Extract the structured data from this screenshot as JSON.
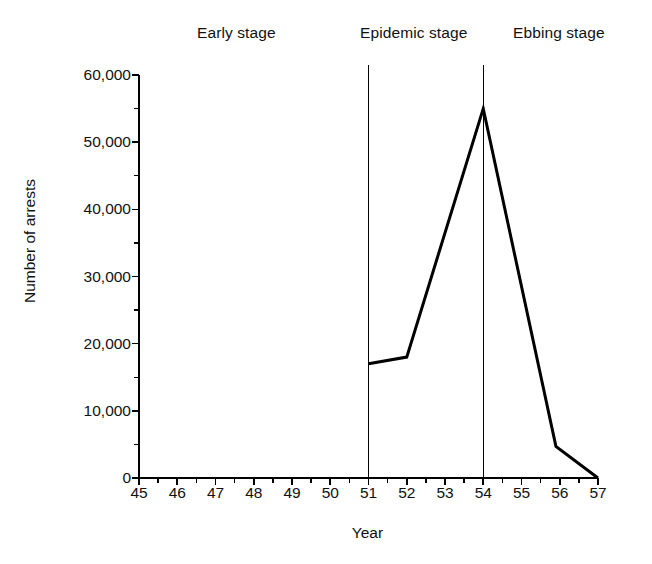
{
  "chart_data": {
    "type": "line",
    "title": "",
    "subtitle": "",
    "xlabel": "Year",
    "ylabel": "Number of arrests",
    "xlim": [
      45,
      57
    ],
    "ylim": [
      0,
      60000
    ],
    "grid": false,
    "legend_position": "none",
    "x_tick_labels": [
      "45",
      "46",
      "47",
      "48",
      "49",
      "50",
      "51",
      "52",
      "53",
      "54",
      "55",
      "56",
      "57"
    ],
    "x_ticks": [
      45,
      46,
      47,
      48,
      49,
      50,
      51,
      52,
      53,
      54,
      55,
      56,
      57
    ],
    "x_minor_tick_step": 0.5,
    "y_tick_labels": [
      "0",
      "10,000",
      "20,000",
      "30,000",
      "40,000",
      "50,000",
      "60,000"
    ],
    "y_ticks": [
      0,
      10000,
      20000,
      30000,
      40000,
      50000,
      60000
    ],
    "y_minor_tick_step": 5000,
    "line_color": "#000000",
    "line_width": 3,
    "series": [
      {
        "name": "Number of arrests",
        "x": [
          51,
          52,
          54,
          55.9,
          57
        ],
        "values": [
          17000,
          18000,
          55000,
          4700,
          0
        ]
      }
    ],
    "annotations": [
      {
        "label": "Early stage",
        "span": [
          45,
          51
        ]
      },
      {
        "label": "Epidemic stage",
        "span": [
          51,
          54
        ]
      },
      {
        "label": "Ebbing stage",
        "span": [
          54,
          57
        ]
      }
    ],
    "dividers": [
      51,
      54
    ]
  },
  "stages": {
    "early": "Early stage",
    "epidemic": "Epidemic stage",
    "ebbing": "Ebbing stage"
  },
  "axes": {
    "x_title": "Year",
    "y_title": "Number of arrests"
  }
}
